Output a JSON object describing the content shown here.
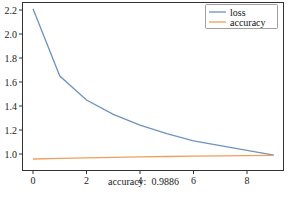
{
  "chart_data": {
    "type": "line",
    "title": "",
    "xlabel": "",
    "ylabel": "",
    "x": [
      0,
      1,
      2,
      3,
      4,
      5,
      6,
      7,
      8,
      9
    ],
    "series": [
      {
        "name": "loss",
        "color": "#6f92bf",
        "values": [
          2.21,
          1.65,
          1.45,
          1.33,
          1.24,
          1.17,
          1.11,
          1.07,
          1.03,
          0.99
        ]
      },
      {
        "name": "accuracy",
        "color": "#f0a05a",
        "values": [
          0.958,
          0.963,
          0.968,
          0.972,
          0.976,
          0.979,
          0.982,
          0.984,
          0.986,
          0.9886
        ]
      }
    ],
    "xticks": [
      0,
      2,
      4,
      6,
      8
    ],
    "xtick_labels": [
      "0",
      "2",
      "4",
      "6",
      "8"
    ],
    "yticks": [
      1.0,
      1.2,
      1.4,
      1.6,
      1.8,
      2.0,
      2.2
    ],
    "ytick_labels": [
      "1.0",
      "1.2",
      "1.4",
      "1.6",
      "1.8",
      "2.0",
      "2.2"
    ],
    "xlim": [
      -0.4,
      9.4
    ],
    "ylim": [
      0.9,
      2.26
    ],
    "grid": false,
    "legend_position": "upper right",
    "annotation": "accuracy:  0.9886"
  },
  "caption": {
    "label": "accuracy:",
    "value": "0.9886"
  }
}
